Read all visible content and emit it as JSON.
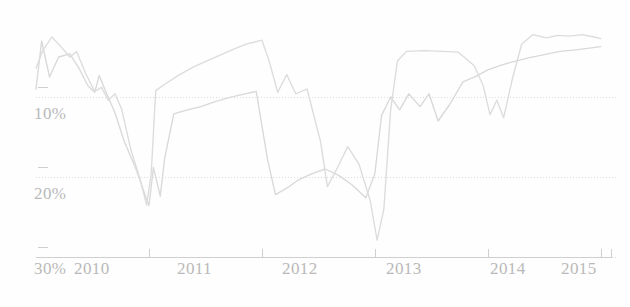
{
  "chart_data": {
    "type": "line",
    "title": "",
    "subtitle": "",
    "xlabel": "",
    "ylabel": "",
    "grid": true,
    "legend_position": "none",
    "y_inverted": true,
    "xlim": [
      2010,
      2015.1
    ],
    "ylim": [
      0,
      30
    ],
    "y_ticks": [
      10,
      20,
      30
    ],
    "y_tick_labels": [
      "10%",
      "20%",
      "30%"
    ],
    "x_ticks": [
      2010,
      2011,
      2012,
      2013,
      2014,
      2015
    ],
    "x_tick_labels": [
      "2010",
      "2011",
      "2012",
      "2013",
      "2014",
      "2015"
    ],
    "series": [
      {
        "name": "series-a",
        "color": "#d9d9d9",
        "points": [
          [
            2010.0,
            9.0
          ],
          [
            2010.05,
            3.0
          ],
          [
            2010.12,
            7.5
          ],
          [
            2010.2,
            5.0
          ],
          [
            2010.3,
            4.6
          ],
          [
            2010.38,
            6.4
          ],
          [
            2010.46,
            8.6
          ],
          [
            2010.52,
            9.4
          ],
          [
            2010.56,
            7.3
          ],
          [
            2010.62,
            9.4
          ],
          [
            2010.7,
            12.0
          ],
          [
            2010.78,
            15.5
          ],
          [
            2010.88,
            18.8
          ],
          [
            2011.0,
            23.6
          ],
          [
            2011.04,
            18.8
          ],
          [
            2011.1,
            22.4
          ],
          [
            2011.14,
            17.6
          ],
          [
            2011.22,
            12.1
          ],
          [
            2011.34,
            11.6
          ],
          [
            2011.46,
            11.2
          ],
          [
            2011.58,
            10.6
          ],
          [
            2011.7,
            10.1
          ],
          [
            2011.82,
            9.7
          ],
          [
            2011.95,
            9.3
          ],
          [
            2012.05,
            17.8
          ],
          [
            2012.12,
            22.2
          ],
          [
            2012.22,
            21.4
          ],
          [
            2012.32,
            20.4
          ],
          [
            2012.44,
            19.6
          ],
          [
            2012.56,
            19.0
          ],
          [
            2012.68,
            19.8
          ],
          [
            2012.8,
            21.0
          ],
          [
            2012.92,
            22.6
          ],
          [
            2013.0,
            19.6
          ],
          [
            2013.06,
            12.3
          ],
          [
            2013.14,
            10.0
          ],
          [
            2013.22,
            11.6
          ],
          [
            2013.3,
            9.6
          ],
          [
            2013.4,
            11.2
          ],
          [
            2013.48,
            9.6
          ],
          [
            2013.56,
            13.0
          ],
          [
            2013.66,
            11.0
          ],
          [
            2013.78,
            8.1
          ],
          [
            2013.9,
            7.4
          ],
          [
            2014.0,
            6.6
          ],
          [
            2014.1,
            6.1
          ],
          [
            2014.22,
            5.6
          ],
          [
            2014.36,
            5.1
          ],
          [
            2014.5,
            4.7
          ],
          [
            2014.64,
            4.3
          ],
          [
            2014.78,
            4.1
          ],
          [
            2014.9,
            3.9
          ],
          [
            2015.0,
            3.7
          ]
        ]
      },
      {
        "name": "series-b",
        "color": "#dcdcdc",
        "points": [
          [
            2010.0,
            6.4
          ],
          [
            2010.06,
            4.2
          ],
          [
            2010.14,
            2.5
          ],
          [
            2010.22,
            3.7
          ],
          [
            2010.3,
            5.0
          ],
          [
            2010.36,
            4.3
          ],
          [
            2010.44,
            7.1
          ],
          [
            2010.52,
            9.3
          ],
          [
            2010.58,
            8.8
          ],
          [
            2010.64,
            10.4
          ],
          [
            2010.7,
            9.6
          ],
          [
            2010.76,
            11.6
          ],
          [
            2010.84,
            16.6
          ],
          [
            2010.92,
            20.2
          ],
          [
            2010.98,
            23.5
          ],
          [
            2011.02,
            19.6
          ],
          [
            2011.06,
            9.2
          ],
          [
            2011.14,
            8.4
          ],
          [
            2011.26,
            7.3
          ],
          [
            2011.4,
            6.2
          ],
          [
            2011.56,
            5.2
          ],
          [
            2011.72,
            4.2
          ],
          [
            2011.86,
            3.4
          ],
          [
            2012.0,
            2.9
          ],
          [
            2012.06,
            5.3
          ],
          [
            2012.14,
            9.4
          ],
          [
            2012.22,
            7.2
          ],
          [
            2012.3,
            9.6
          ],
          [
            2012.4,
            9.0
          ],
          [
            2012.52,
            15.6
          ],
          [
            2012.58,
            21.2
          ],
          [
            2012.66,
            19.1
          ],
          [
            2012.76,
            16.2
          ],
          [
            2012.86,
            18.4
          ],
          [
            2012.96,
            23.0
          ],
          [
            2013.02,
            27.9
          ],
          [
            2013.08,
            24.0
          ],
          [
            2013.14,
            11.6
          ],
          [
            2013.2,
            5.5
          ],
          [
            2013.28,
            4.3
          ],
          [
            2013.44,
            4.2
          ],
          [
            2013.6,
            4.3
          ],
          [
            2013.74,
            4.4
          ],
          [
            2013.88,
            6.1
          ],
          [
            2013.96,
            8.6
          ],
          [
            2014.02,
            12.2
          ],
          [
            2014.08,
            10.4
          ],
          [
            2014.14,
            12.6
          ],
          [
            2014.22,
            7.6
          ],
          [
            2014.3,
            3.4
          ],
          [
            2014.4,
            2.2
          ],
          [
            2014.52,
            2.6
          ],
          [
            2014.62,
            2.3
          ],
          [
            2014.72,
            2.4
          ],
          [
            2014.84,
            2.2
          ],
          [
            2014.94,
            2.5
          ],
          [
            2015.0,
            2.7
          ]
        ]
      }
    ]
  },
  "axes": {
    "y_tick_10": "10%",
    "y_tick_20": "20%",
    "y_tick_30": "30%",
    "x_tick_2010": "2010",
    "x_tick_2011": "2011",
    "x_tick_2012": "2012",
    "x_tick_2013": "2013",
    "x_tick_2014": "2014",
    "x_tick_2015": "2015"
  },
  "style": {
    "background": "#fefefe",
    "grid_color": "#dedede",
    "axis_color": "#cfcfcf",
    "text_color": "#b9b9b9",
    "series_a_color": "#d9d9d9",
    "series_b_color": "#dcdcdc"
  }
}
